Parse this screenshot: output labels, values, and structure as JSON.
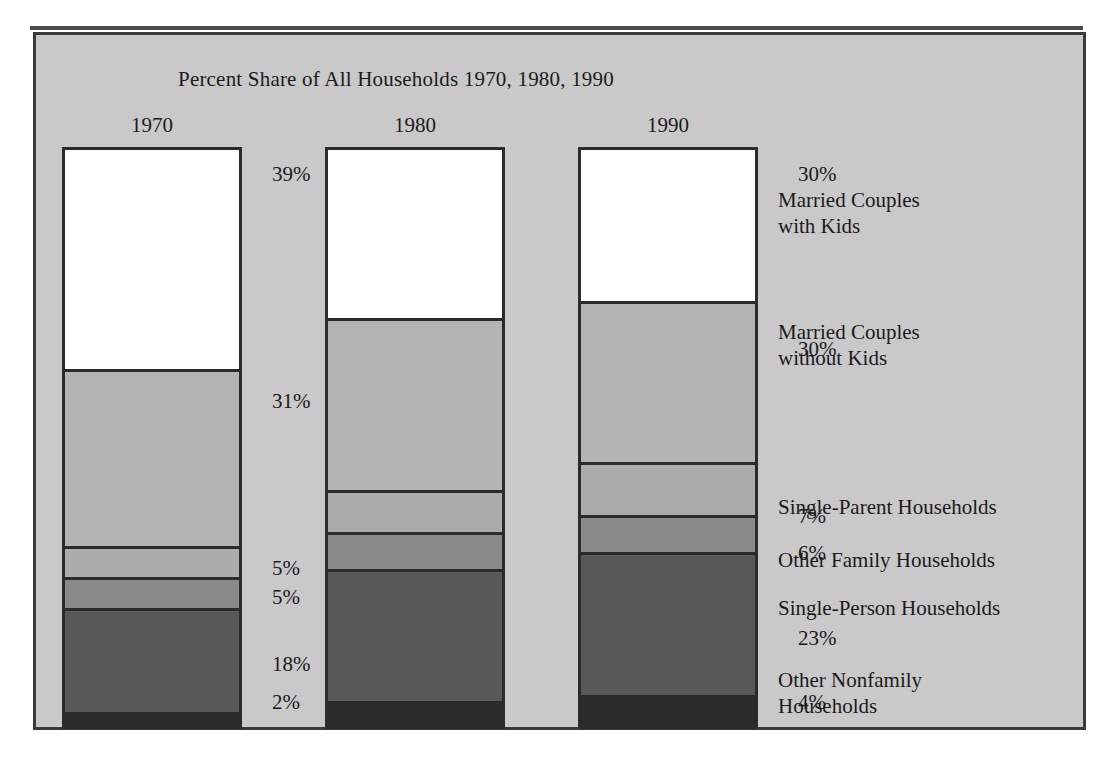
{
  "figure": {
    "title": "Percent Share of All Households 1970, 1980, 1990",
    "background_color": "#c9c9c9",
    "frame_color": "#3a3a3a"
  },
  "legend": {
    "items": [
      {
        "label": "Married Couples\nwith Kids",
        "line1": "Married Couples",
        "line2": "with Kids",
        "color": "#ffffff",
        "value_1990": "27%"
      },
      {
        "label": "Married Couples\nwithout Kids",
        "line1": "Married Couples",
        "line2": "without Kids",
        "color": "#b4b4b4",
        "value_1990": "28%"
      },
      {
        "label": "Single-Parent Households",
        "line1": "Single-Parent Households",
        "line2": "",
        "color": "#ababab",
        "value_1990": "9%"
      },
      {
        "label": "Other Family Households",
        "line1": "Other Family Households",
        "line2": "",
        "color": "#8a8a8a",
        "value_1990": "6%"
      },
      {
        "label": "Single-Person Households",
        "line1": "Single-Person Households",
        "line2": "",
        "color": "#585858",
        "value_1990": "25%"
      },
      {
        "label": "Other Nonfamily\nHouseholds",
        "line1": "Other Nonfamily",
        "line2": "Households",
        "color": "#2a2a2a",
        "value_1990": "5%"
      }
    ]
  },
  "chart_data": {
    "type": "bar",
    "stacked": true,
    "title": "Percent Share of All Households 1970, 1980, 1990",
    "xlabel": "",
    "ylabel": "Percent Share of All Households",
    "ylim": [
      0,
      100
    ],
    "grid": false,
    "legend_position": "right",
    "categories": [
      "1970",
      "1980",
      "1990"
    ],
    "series": [
      {
        "name": "Married Couples with Kids",
        "color": "#ffffff",
        "values": [
          39,
          30,
          27
        ],
        "labels": [
          "39%",
          "30%",
          "27%"
        ]
      },
      {
        "name": "Married Couples without Kids",
        "color": "#b4b4b4",
        "values": [
          31,
          30,
          28
        ],
        "labels": [
          "31%",
          "30%",
          "28%"
        ]
      },
      {
        "name": "Single-Parent Households",
        "color": "#ababab",
        "values": [
          5,
          7,
          9
        ],
        "labels": [
          "5%",
          "7%",
          "9%"
        ]
      },
      {
        "name": "Other Family Households",
        "color": "#8a8a8a",
        "values": [
          5,
          6,
          6
        ],
        "labels": [
          "5%",
          "6%",
          "6%"
        ]
      },
      {
        "name": "Single-Person Households",
        "color": "#585858",
        "values": [
          18,
          23,
          25
        ],
        "labels": [
          "18%",
          "23%",
          "25%"
        ]
      },
      {
        "name": "Other Nonfamily Households",
        "color": "#2a2a2a",
        "values": [
          2,
          4,
          5
        ],
        "labels": [
          "2%",
          "4%",
          "5%"
        ]
      }
    ]
  },
  "bars": [
    {
      "year": "1970",
      "segments": [
        {
          "name": "Married Couples with Kids",
          "value": 39,
          "label": "39%",
          "color": "#ffffff"
        },
        {
          "name": "Married Couples without Kids",
          "value": 31,
          "label": "31%",
          "color": "#b4b4b4"
        },
        {
          "name": "Single-Parent Households",
          "value": 5,
          "label": "5%",
          "color": "#ababab"
        },
        {
          "name": "Other Family Households",
          "value": 5,
          "label": "5%",
          "color": "#8a8a8a"
        },
        {
          "name": "Single-Person Households",
          "value": 18,
          "label": "18%",
          "color": "#585858"
        },
        {
          "name": "Other Nonfamily Households",
          "value": 2,
          "label": "2%",
          "color": "#2a2a2a"
        }
      ]
    },
    {
      "year": "1980",
      "segments": [
        {
          "name": "Married Couples with Kids",
          "value": 30,
          "label": "30%",
          "color": "#ffffff"
        },
        {
          "name": "Married Couples without Kids",
          "value": 30,
          "label": "30%",
          "color": "#b4b4b4"
        },
        {
          "name": "Single-Parent Households",
          "value": 7,
          "label": "7%",
          "color": "#ababab"
        },
        {
          "name": "Other Family Households",
          "value": 6,
          "label": "6%",
          "color": "#8a8a8a"
        },
        {
          "name": "Single-Person Households",
          "value": 23,
          "label": "23%",
          "color": "#585858"
        },
        {
          "name": "Other Nonfamily Households",
          "value": 4,
          "label": "4%",
          "color": "#2a2a2a"
        }
      ]
    },
    {
      "year": "1990",
      "segments": [
        {
          "name": "Married Couples with Kids",
          "value": 27,
          "label": "27%",
          "color": "#ffffff"
        },
        {
          "name": "Married Couples without Kids",
          "value": 28,
          "label": "28%",
          "color": "#b4b4b4"
        },
        {
          "name": "Single-Parent Households",
          "value": 9,
          "label": "9%",
          "color": "#ababab"
        },
        {
          "name": "Other Family Households",
          "value": 6,
          "label": "6%",
          "color": "#8a8a8a"
        },
        {
          "name": "Single-Person Households",
          "value": 25,
          "label": "25%",
          "color": "#585858"
        },
        {
          "name": "Other Nonfamily Households",
          "value": 5,
          "label": "5%",
          "color": "#2a2a2a"
        }
      ]
    }
  ]
}
